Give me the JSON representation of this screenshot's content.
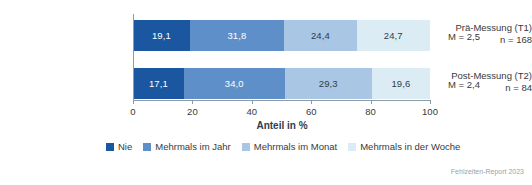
{
  "chart_data": {
    "type": "bar",
    "orientation": "horizontal",
    "stacked": true,
    "title": "",
    "xlabel": "Anteil in %",
    "ylabel": "",
    "xlim": [
      0,
      100
    ],
    "xticks": [
      0,
      20,
      40,
      60,
      80,
      100
    ],
    "xticklabels": [
      "0",
      "20",
      "40",
      "60",
      "80",
      "100"
    ],
    "grid": false,
    "legend_position": "bottom",
    "categories": [
      "Prä-Messung (T1)",
      "Post-Messung (T2)"
    ],
    "category_sublabels": [
      "n = 168",
      "n = 84"
    ],
    "series": [
      {
        "name": "Nie",
        "color": "#1a57a0",
        "values": [
          19.1,
          17.1
        ],
        "labels": [
          "19,1",
          "17,1"
        ]
      },
      {
        "name": "Mehrmals im Jahr",
        "color": "#5e8fc8",
        "values": [
          31.8,
          34.0
        ],
        "labels": [
          "31,8",
          "34,0"
        ]
      },
      {
        "name": "Mehrmals im Monat",
        "color": "#a9c6e4",
        "values": [
          24.4,
          29.3
        ],
        "labels": [
          "24,4",
          "29,3"
        ]
      },
      {
        "name": "Mehrmals in der Woche",
        "color": "#dcecf4",
        "values": [
          24.7,
          19.6
        ],
        "labels": [
          "24,7",
          "19,6"
        ]
      }
    ],
    "annotations": [
      {
        "text": "M = 2,5",
        "for": "Prä-Messung (T1)"
      },
      {
        "text": "M = 2,4",
        "for": "Post-Messung (T2)"
      }
    ]
  },
  "footer": {
    "source": "Fehlzeiten-Report 2023"
  }
}
